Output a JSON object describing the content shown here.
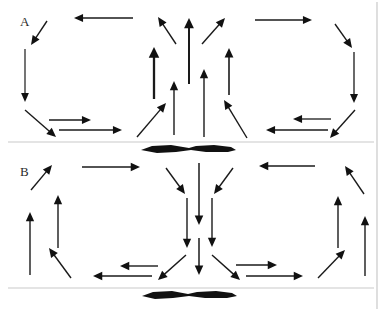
{
  "figure": {
    "width": 387,
    "height": 311,
    "background_color": "#ffffff",
    "stroke_color": "#1a1a1a",
    "rule_color": "#c9c9c9",
    "blob_color": "#111111"
  },
  "panels": [
    {
      "id": "A",
      "label": "A",
      "label_x": 20,
      "label_y": 26,
      "pattern": "divergent-upwelling",
      "description": "Flow converges inward along the baseline, rises through a broad central column, and diverges outward and downward at the sides.",
      "baseline_y": 142,
      "arrow_count": 20
    },
    {
      "id": "B",
      "label": "B",
      "label_x": 20,
      "label_y": 176,
      "pattern": "convergent-downwelling",
      "description": "Flow descends through a central column, spreads outward along the baseline, and rises along the left and right margins.",
      "baseline_y": 288,
      "arrow_count": 22
    }
  ],
  "rules": [
    {
      "name": "panel-a-baseline",
      "x1": 8,
      "y1": 142,
      "x2": 374,
      "y2": 142
    },
    {
      "name": "panel-b-baseline",
      "x1": 8,
      "y1": 288,
      "x2": 374,
      "y2": 288
    },
    {
      "name": "right-frame",
      "x1": 377,
      "y1": 2,
      "x2": 377,
      "y2": 309
    }
  ],
  "blobs": [
    {
      "name": "panel-a-baseline-blob",
      "cx": 188,
      "cy": 149,
      "width": 96,
      "height": 8,
      "points": "141,150 152,146 171,145 189,148 196,146 214,145 231,147 236,150 228,152 206,152 191,150 176,152 157,153"
    },
    {
      "name": "panel-b-baseline-blob",
      "cx": 188,
      "cy": 295,
      "width": 94,
      "height": 8,
      "points": "142,296 153,292 172,291 188,294 197,292 216,291 232,293 237,296 227,298 205,298 189,296 173,298 155,299"
    }
  ],
  "arrows_panel_a": [
    {
      "name": "a-top-left-horizontal-left",
      "x1": 133,
      "y1": 18,
      "x2": 74,
      "y2": 18,
      "w": 1.3
    },
    {
      "name": "a-upper-left-diagonal-down",
      "x1": 47,
      "y1": 21,
      "x2": 31,
      "y2": 45,
      "w": 1.4
    },
    {
      "name": "a-left-vertical-down",
      "x1": 25,
      "y1": 49,
      "x2": 25,
      "y2": 102,
      "w": 1.2
    },
    {
      "name": "a-lower-left-diagonal-down",
      "x1": 25,
      "y1": 110,
      "x2": 56,
      "y2": 137,
      "w": 1.4
    },
    {
      "name": "a-bottom-left-horiz-1",
      "x1": 49,
      "y1": 120,
      "x2": 91,
      "y2": 120,
      "w": 1.3
    },
    {
      "name": "a-bottom-left-horiz-2",
      "x1": 59,
      "y1": 130,
      "x2": 122,
      "y2": 130,
      "w": 1.3
    },
    {
      "name": "a-center-in-left-diagonal",
      "x1": 137,
      "y1": 137,
      "x2": 166,
      "y2": 103,
      "w": 1.4
    },
    {
      "name": "a-center-col-1-up",
      "x1": 154,
      "y1": 99,
      "x2": 154,
      "y2": 47,
      "w": 2.3
    },
    {
      "name": "a-center-col-2-up",
      "x1": 174,
      "y1": 135,
      "x2": 174,
      "y2": 81,
      "w": 1.4
    },
    {
      "name": "a-center-col-3-up",
      "x1": 189,
      "y1": 84,
      "x2": 189,
      "y2": 18,
      "w": 2.0
    },
    {
      "name": "a-center-col-4-up",
      "x1": 204,
      "y1": 137,
      "x2": 204,
      "y2": 69,
      "w": 1.4
    },
    {
      "name": "a-center-col-5-up",
      "x1": 229,
      "y1": 95,
      "x2": 229,
      "y2": 48,
      "w": 1.6
    },
    {
      "name": "a-center-in-right-diagonal",
      "x1": 247,
      "y1": 138,
      "x2": 224,
      "y2": 100,
      "w": 1.4
    },
    {
      "name": "a-upper-center-left-diag",
      "x1": 176,
      "y1": 44,
      "x2": 158,
      "y2": 17,
      "w": 1.4
    },
    {
      "name": "a-upper-center-right-diag",
      "x1": 202,
      "y1": 44,
      "x2": 225,
      "y2": 18,
      "w": 1.4
    },
    {
      "name": "a-top-right-horizontal-right",
      "x1": 255,
      "y1": 20,
      "x2": 312,
      "y2": 20,
      "w": 1.3
    },
    {
      "name": "a-upper-right-diagonal-down",
      "x1": 335,
      "y1": 24,
      "x2": 352,
      "y2": 48,
      "w": 1.4
    },
    {
      "name": "a-right-vertical-down",
      "x1": 354,
      "y1": 52,
      "x2": 354,
      "y2": 103,
      "w": 1.3
    },
    {
      "name": "a-lower-right-diagonal-down",
      "x1": 355,
      "y1": 110,
      "x2": 330,
      "y2": 138,
      "w": 1.4
    },
    {
      "name": "a-bottom-right-horiz-1",
      "x1": 331,
      "y1": 119,
      "x2": 293,
      "y2": 119,
      "w": 1.3
    },
    {
      "name": "a-bottom-right-horiz-2",
      "x1": 328,
      "y1": 130,
      "x2": 266,
      "y2": 130,
      "w": 1.3
    }
  ],
  "arrows_panel_b": [
    {
      "name": "b-upper-left-diagonal-up",
      "x1": 31,
      "y1": 190,
      "x2": 52,
      "y2": 165,
      "w": 1.4
    },
    {
      "name": "b-top-left-horizontal-right",
      "x1": 82,
      "y1": 167,
      "x2": 140,
      "y2": 167,
      "w": 1.4
    },
    {
      "name": "b-left-inner-vertical-up",
      "x1": 58,
      "y1": 248,
      "x2": 58,
      "y2": 195,
      "w": 1.4
    },
    {
      "name": "b-left-outer-vertical-up",
      "x1": 30,
      "y1": 275,
      "x2": 30,
      "y2": 212,
      "w": 1.4
    },
    {
      "name": "b-lower-left-diagonal-up",
      "x1": 71,
      "y1": 278,
      "x2": 49,
      "y2": 248,
      "w": 1.4
    },
    {
      "name": "b-bottom-left-horiz-1",
      "x1": 158,
      "y1": 266,
      "x2": 120,
      "y2": 266,
      "w": 1.4
    },
    {
      "name": "b-bottom-left-horiz-2",
      "x1": 152,
      "y1": 276,
      "x2": 93,
      "y2": 276,
      "w": 1.4
    },
    {
      "name": "b-center-in-left-diagonal",
      "x1": 166,
      "y1": 168,
      "x2": 185,
      "y2": 194,
      "w": 1.4
    },
    {
      "name": "b-center-col-left-down",
      "x1": 187,
      "y1": 198,
      "x2": 187,
      "y2": 248,
      "w": 1.4
    },
    {
      "name": "b-center-col-mid-down",
      "x1": 199,
      "y1": 163,
      "x2": 199,
      "y2": 225,
      "w": 1.5
    },
    {
      "name": "b-center-col-lower-down",
      "x1": 199,
      "y1": 238,
      "x2": 199,
      "y2": 275,
      "w": 1.5
    },
    {
      "name": "b-center-col-right-down",
      "x1": 212,
      "y1": 198,
      "x2": 212,
      "y2": 247,
      "w": 1.4
    },
    {
      "name": "b-center-in-right-diagonal",
      "x1": 233,
      "y1": 168,
      "x2": 214,
      "y2": 194,
      "w": 1.4
    },
    {
      "name": "b-out-bottom-left-diagonal",
      "x1": 186,
      "y1": 255,
      "x2": 158,
      "y2": 280,
      "w": 1.4
    },
    {
      "name": "b-out-bottom-right-diagonal",
      "x1": 212,
      "y1": 255,
      "x2": 240,
      "y2": 280,
      "w": 1.4
    },
    {
      "name": "b-bottom-right-horiz-1",
      "x1": 236,
      "y1": 265,
      "x2": 277,
      "y2": 265,
      "w": 1.4
    },
    {
      "name": "b-bottom-right-horiz-2",
      "x1": 246,
      "y1": 276,
      "x2": 303,
      "y2": 276,
      "w": 1.4
    },
    {
      "name": "b-top-right-horizontal-left",
      "x1": 315,
      "y1": 166,
      "x2": 259,
      "y2": 166,
      "w": 1.4
    },
    {
      "name": "b-upper-right-diagonal-up",
      "x1": 364,
      "y1": 194,
      "x2": 345,
      "y2": 166,
      "w": 1.4
    },
    {
      "name": "b-right-inner-vertical-up",
      "x1": 338,
      "y1": 248,
      "x2": 338,
      "y2": 196,
      "w": 1.4
    },
    {
      "name": "b-right-outer-vertical-up",
      "x1": 365,
      "y1": 276,
      "x2": 365,
      "y2": 216,
      "w": 1.4
    },
    {
      "name": "b-lower-right-diagonal-up",
      "x1": 318,
      "y1": 278,
      "x2": 345,
      "y2": 250,
      "w": 1.4
    }
  ]
}
